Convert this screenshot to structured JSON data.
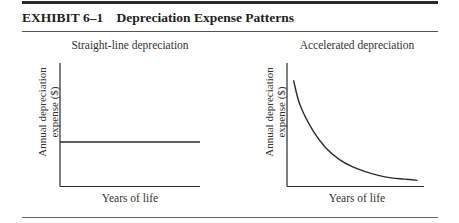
{
  "exhibit": {
    "number": "EXHIBIT 6–1",
    "title": "Depreciation Expense Patterns"
  },
  "chart_data": [
    {
      "type": "line",
      "title": "Straight-line depreciation",
      "xlabel": "Years of life",
      "ylabel": "Annual depreciation expense ($)",
      "ylabel_lines": [
        "Annual depreciation",
        "expense ($)"
      ],
      "x": [
        0,
        1,
        2,
        3,
        4,
        5,
        6,
        7,
        8,
        9,
        10
      ],
      "values": [
        0.36,
        0.36,
        0.36,
        0.36,
        0.36,
        0.36,
        0.36,
        0.36,
        0.36,
        0.36,
        0.36
      ],
      "xlim": [
        0,
        10
      ],
      "ylim": [
        0,
        1
      ],
      "grid": false,
      "ticks": false,
      "legend": "none",
      "description": "Constant horizontal line — same expense every year"
    },
    {
      "type": "line",
      "title": "Accelerated depreciation",
      "xlabel": "Years of life",
      "ylabel": "Annual depreciation expense ($)",
      "ylabel_lines": [
        "Annual depreciation",
        "expense ($)"
      ],
      "x": [
        0.5,
        1,
        2,
        3,
        4,
        5,
        6,
        7,
        8,
        9,
        10
      ],
      "values": [
        0.86,
        0.66,
        0.45,
        0.31,
        0.22,
        0.16,
        0.12,
        0.09,
        0.07,
        0.06,
        0.05
      ],
      "xlim": [
        0,
        10.5
      ],
      "ylim": [
        0,
        1
      ],
      "grid": false,
      "ticks": false,
      "legend": "none",
      "description": "Decreasing convex curve — expense highest early, declining over life"
    }
  ]
}
